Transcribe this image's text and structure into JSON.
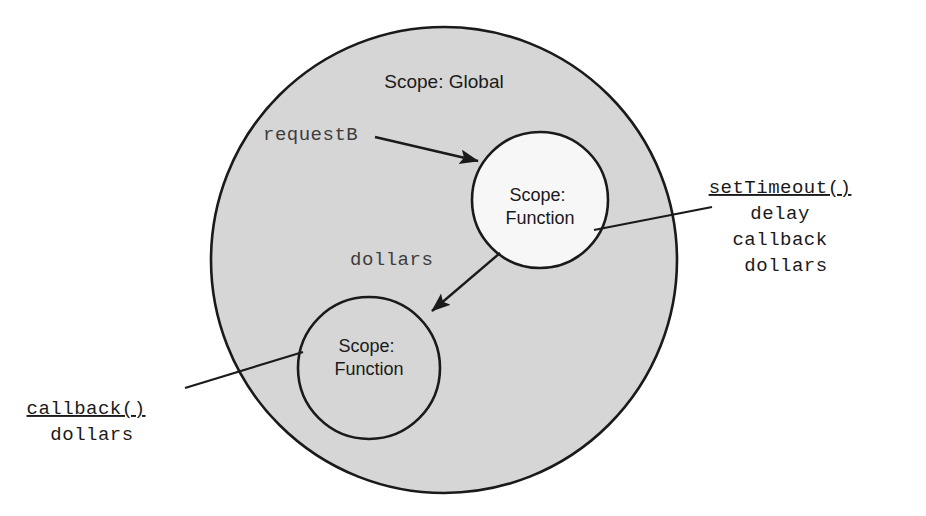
{
  "diagram": {
    "background_color": "#ffffff",
    "stroke_color": "#1a1a1a",
    "global_scope": {
      "label": "Scope: Global",
      "fill_color": "#d6d6d6",
      "center_x": 444,
      "center_y": 260,
      "radius": 233,
      "label_x": 444,
      "label_y": 88
    },
    "function_scopes": [
      {
        "id": "upper",
        "label_line1": "Scope:",
        "label_line2": "Function",
        "fill_color": "#f7f7f7",
        "center_x": 540,
        "center_y": 200,
        "radius": 68
      },
      {
        "id": "lower",
        "label_line1": "Scope:",
        "label_line2": "Function",
        "fill_color": "#d6d6d6",
        "center_x": 369,
        "center_y": 368,
        "radius": 71
      }
    ],
    "variable_arrows": [
      {
        "id": "requestB",
        "label": "requestB",
        "label_x": 263,
        "label_y": 140,
        "from_x": 375,
        "from_y": 137,
        "to_x": 478,
        "to_y": 161
      },
      {
        "id": "dollars",
        "label": "dollars",
        "label_x": 350,
        "label_y": 265,
        "from_x": 500,
        "from_y": 253,
        "to_x": 432,
        "to_y": 311
      }
    ],
    "callouts": [
      {
        "id": "settimeout",
        "heading": "setTimeout()",
        "items": [
          "delay",
          "callback",
          "dollars"
        ],
        "text_x": 786,
        "text_y": 193,
        "text_anchor": "middle",
        "leader_from_x": 712,
        "leader_from_y": 207,
        "leader_to_x": 594,
        "leader_to_y": 230
      },
      {
        "id": "callback",
        "heading": "callback()",
        "items": [
          "dollars"
        ],
        "text_x": 92,
        "text_y": 414,
        "text_anchor": "middle",
        "leader_from_x": 185,
        "leader_from_y": 388,
        "leader_to_x": 303,
        "leader_to_y": 352
      }
    ]
  }
}
